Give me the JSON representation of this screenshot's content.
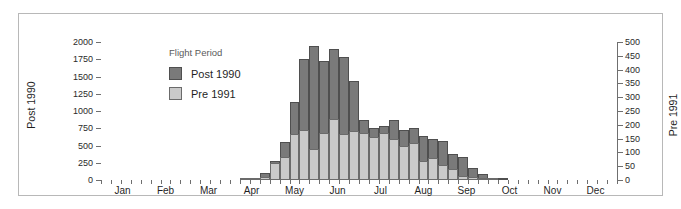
{
  "chart_data": {
    "type": "bar",
    "title": "",
    "subtitle": "",
    "xlabel": "",
    "ylabel": "Post 1990",
    "y2label": "Pre 1991",
    "ylim": [
      0,
      2000
    ],
    "y2lim": [
      0,
      500
    ],
    "grid": false,
    "stacked_overlay": true,
    "legend": {
      "title": "Flight Period",
      "position": "inside-top-left",
      "entries": [
        {
          "label": "Post 1990",
          "color": "#7a7a7a"
        },
        {
          "label": "Pre 1991",
          "color": "#cacaca"
        }
      ]
    },
    "colors": {
      "post_1990": "#7a7a7a",
      "post_1990_edge": "#4f4f4f",
      "pre_1991": "#cacaca",
      "pre_1991_edge": "#6b6b6b",
      "axis": "#6f6f6f",
      "frame": "#b8b8b8",
      "text": "#1f1f1f"
    },
    "yticks": [
      0,
      250,
      500,
      750,
      1000,
      1250,
      1500,
      1750,
      2000
    ],
    "y2ticks": [
      0,
      50,
      100,
      150,
      200,
      250,
      300,
      350,
      400,
      450,
      500
    ],
    "xtick_labels": [
      "Jan",
      "Feb",
      "Mar",
      "Apr",
      "May",
      "Jun",
      "Jul",
      "Aug",
      "Sep",
      "Oct",
      "Nov",
      "Dec"
    ],
    "x_bin": "week",
    "x_bin_count": 52,
    "x": [
      1,
      2,
      3,
      4,
      5,
      6,
      7,
      8,
      9,
      10,
      11,
      12,
      13,
      14,
      15,
      16,
      17,
      18,
      19,
      20,
      21,
      22,
      23,
      24,
      25,
      26,
      27,
      28,
      29,
      30,
      31,
      32,
      33,
      34,
      35,
      36,
      37,
      38,
      39,
      40,
      41,
      42,
      43,
      44,
      45,
      46,
      47,
      48,
      49,
      50,
      51,
      52
    ],
    "series": [
      {
        "name": "Post 1990",
        "axis": "left",
        "values": [
          0,
          0,
          0,
          0,
          0,
          0,
          0,
          0,
          0,
          0,
          0,
          0,
          0,
          0,
          20,
          25,
          100,
          280,
          545,
          1125,
          1760,
          1945,
          1720,
          1900,
          1790,
          1430,
          875,
          760,
          790,
          870,
          725,
          760,
          640,
          590,
          565,
          380,
          340,
          180,
          90,
          30,
          8,
          0,
          0,
          0,
          0,
          0,
          0,
          0,
          0,
          0,
          0,
          0
        ]
      },
      {
        "name": "Pre 1991",
        "axis": "right",
        "values": [
          0,
          0,
          0,
          0,
          0,
          0,
          0,
          0,
          0,
          0,
          0,
          0,
          0,
          0,
          3,
          4,
          12,
          62,
          85,
          165,
          180,
          113,
          170,
          222,
          165,
          178,
          170,
          155,
          172,
          150,
          125,
          135,
          70,
          80,
          55,
          40,
          15,
          12,
          6,
          2,
          0,
          0,
          0,
          0,
          0,
          0,
          0,
          0,
          0,
          0,
          0,
          0
        ]
      }
    ]
  }
}
